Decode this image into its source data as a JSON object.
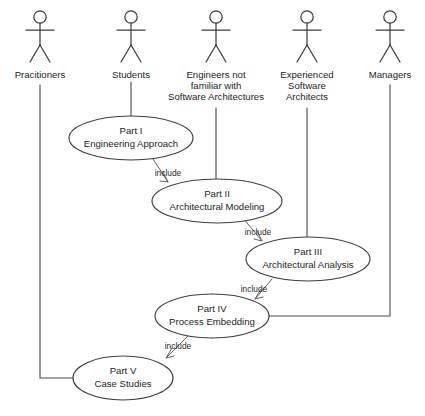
{
  "diagram": {
    "type": "uml-use-case-diagram",
    "colors": {
      "background": "#ffffff",
      "stroke": "#3d3d3d",
      "connector": "#4a4a4a",
      "text": "#1d1d1d"
    },
    "actors": [
      {
        "id": "practitioners",
        "icon": "actor-stick-figure-icon",
        "lines": [
          "Pracitioners"
        ],
        "cx": 40,
        "head_cy": 17,
        "label_y": 78
      },
      {
        "id": "students",
        "icon": "actor-stick-figure-icon",
        "lines": [
          "Students"
        ],
        "cx": 131,
        "head_cy": 17,
        "label_y": 78
      },
      {
        "id": "engineers-not-familiar",
        "icon": "actor-stick-figure-icon",
        "lines": [
          "Engineers not",
          "familiar with",
          "Software Architectures"
        ],
        "cx": 216,
        "head_cy": 17,
        "label_y": 78
      },
      {
        "id": "experienced-software-architects",
        "icon": "actor-stick-figure-icon",
        "lines": [
          "Experienced",
          "Software",
          "Architects"
        ],
        "cx": 307,
        "head_cy": 17,
        "label_y": 78
      },
      {
        "id": "managers",
        "icon": "actor-stick-figure-icon",
        "lines": [
          "Managers"
        ],
        "cx": 390,
        "head_cy": 17,
        "label_y": 78
      }
    ],
    "use_cases": [
      {
        "id": "part-1",
        "title": "Part I",
        "subtitle": "Engineering Approach",
        "cx": 131,
        "cy": 138,
        "rx": 62,
        "ry": 22
      },
      {
        "id": "part-2",
        "title": "Part II",
        "subtitle": "Architectural Modeling",
        "cx": 217,
        "cy": 201,
        "rx": 65,
        "ry": 22
      },
      {
        "id": "part-3",
        "title": "Part III",
        "subtitle": "Architectural Analysis",
        "cx": 308,
        "cy": 259,
        "rx": 62,
        "ry": 22
      },
      {
        "id": "part-4",
        "title": "Part IV",
        "subtitle": "Process Embedding",
        "cx": 212,
        "cy": 316,
        "rx": 57,
        "ry": 22
      },
      {
        "id": "part-5",
        "title": "Part V",
        "subtitle": "Case Studies",
        "cx": 123,
        "cy": 378,
        "rx": 50,
        "ry": 22
      }
    ],
    "associations": [
      {
        "id": "assoc-practitioners-part5",
        "from": "practitioners",
        "to": "part-5"
      },
      {
        "id": "assoc-students-part1",
        "from": "students",
        "to": "part-1"
      },
      {
        "id": "assoc-engineers-part2",
        "from": "engineers-not-familiar",
        "to": "part-2"
      },
      {
        "id": "assoc-architects-part3",
        "from": "experienced-software-architects",
        "to": "part-3"
      },
      {
        "id": "assoc-managers-part4",
        "from": "managers",
        "to": "part-4"
      }
    ],
    "include_dependencies": [
      {
        "id": "include-part1-part2",
        "label": "include",
        "from": "part-1",
        "to": "part-2",
        "label_x": 168,
        "label_y": 175
      },
      {
        "id": "include-part2-part3",
        "label": "include",
        "from": "part-2",
        "to": "part-3",
        "label_x": 258,
        "label_y": 234
      },
      {
        "id": "include-part3-part4",
        "label": "include",
        "from": "part-3",
        "to": "part-4",
        "label_x": 253,
        "label_y": 291
      },
      {
        "id": "include-part4-part5",
        "label": "include",
        "from": "part-4",
        "to": "part-5",
        "label_x": 177,
        "label_y": 348
      }
    ]
  }
}
